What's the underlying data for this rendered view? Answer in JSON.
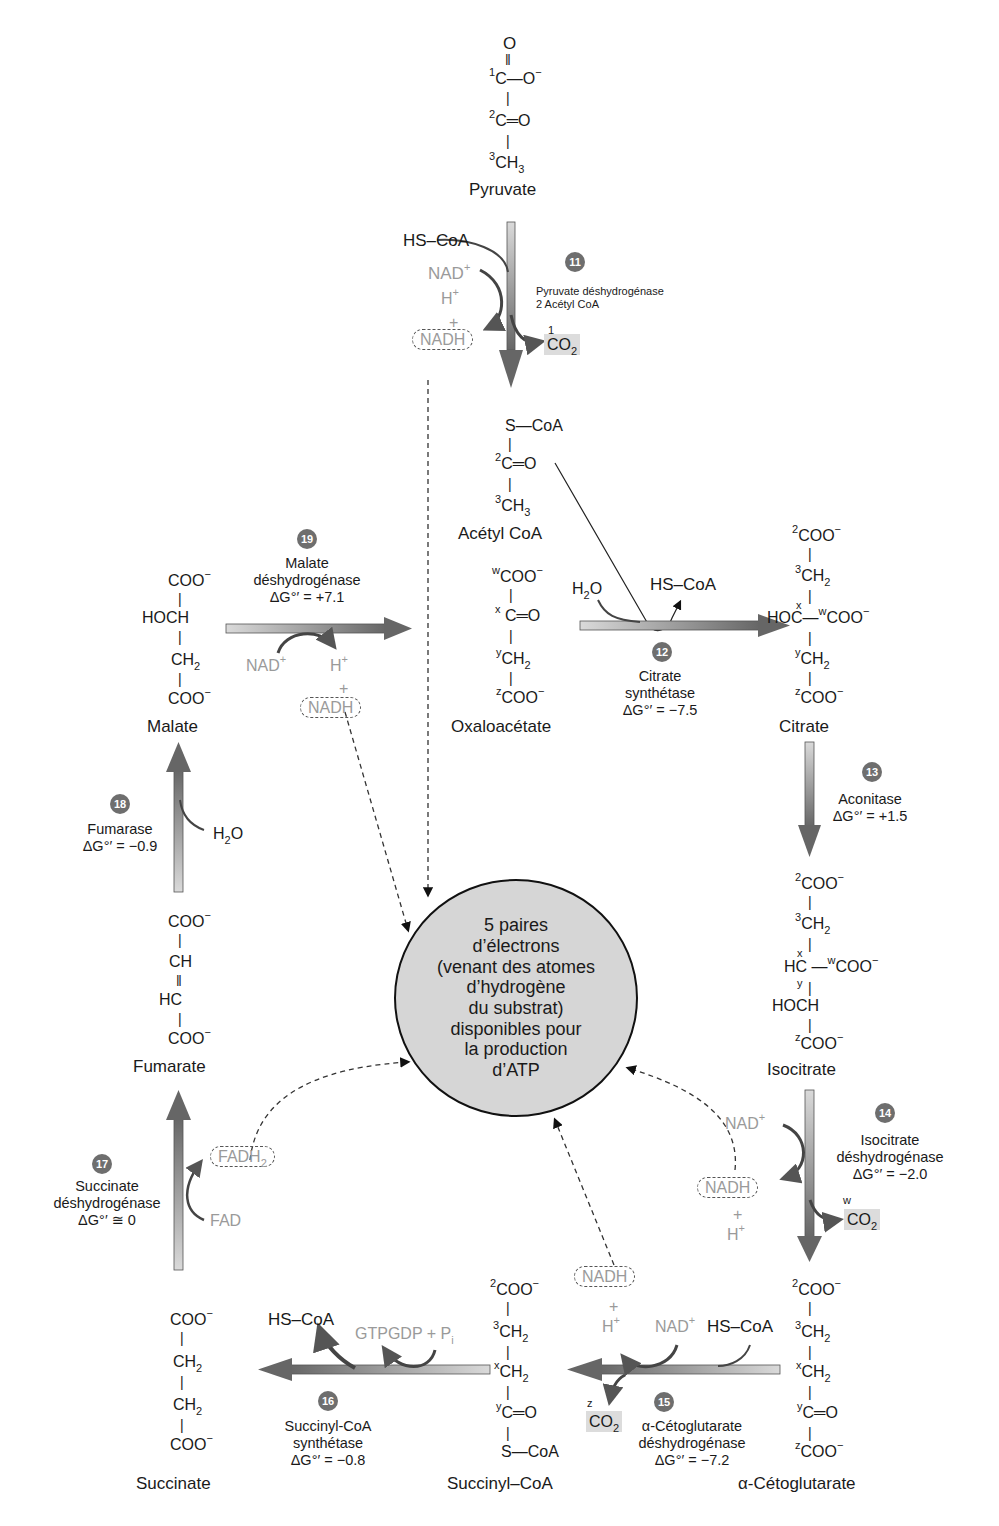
{
  "colors": {
    "badge": "#6e6e6e",
    "arrow_light": "#d0d0d0",
    "arrow_dark": "#6a6a6a",
    "cofactor_grey": "#9a9a9a",
    "co2_box": "#dcdcdc",
    "circle_fill": "#d6d6d6"
  },
  "center": {
    "lines": [
      "5 paires",
      "d’électrons",
      "(venant des atomes",
      "d’hydrogène",
      "du substrat)",
      "disponibles pour",
      "la production",
      "d’ATP"
    ]
  },
  "molecules": {
    "pyruvate": {
      "name": "Pyruvate",
      "atoms": [
        "O",
        "C—O⁻",
        "C═O",
        "CH3"
      ],
      "numbers": [
        "1",
        "2",
        "3"
      ]
    },
    "acetyl_coa": {
      "name": "Acétyl CoA",
      "atoms": [
        "S—CoA",
        "C═O",
        "CH3"
      ],
      "numbers": [
        "2",
        "3"
      ]
    },
    "oxaloacetate": {
      "name": "Oxaloacétate",
      "atoms": [
        "COO⁻",
        "C═O",
        "CH2",
        "COO⁻"
      ],
      "labels": [
        "w",
        "x",
        "y",
        "z"
      ]
    },
    "citrate": {
      "name": "Citrate",
      "atoms": [
        "COO⁻",
        "CH2",
        "HOC—COO⁻",
        "CH2",
        "COO⁻"
      ],
      "labels": [
        "2",
        "3",
        "x",
        "w",
        "y",
        "z"
      ]
    },
    "isocitrate": {
      "name": "Isocitrate",
      "atoms": [
        "COO⁻",
        "CH2",
        "HC—COO⁻",
        "HOCH",
        "COO⁻"
      ],
      "labels": [
        "2",
        "3",
        "x",
        "w",
        "y",
        "z"
      ]
    },
    "alpha_cetoglutarate": {
      "name": "α-Cétoglutarate",
      "atoms": [
        "COO⁻",
        "CH2",
        "CH2",
        "C═O",
        "COO⁻"
      ],
      "labels": [
        "2",
        "3",
        "x",
        "y",
        "z"
      ]
    },
    "succinyl_coa": {
      "name": "Succinyl–CoA",
      "atoms": [
        "COO⁻",
        "CH2",
        "CH2",
        "C═O",
        "S—CoA"
      ],
      "labels": [
        "2",
        "3",
        "x",
        "y"
      ]
    },
    "succinate": {
      "name": "Succinate",
      "atoms": [
        "COO⁻",
        "CH2",
        "CH2",
        "COO⁻"
      ]
    },
    "fumarate": {
      "name": "Fumarate",
      "atoms": [
        "COO⁻",
        "CH",
        "HC",
        "COO⁻"
      ]
    },
    "malate": {
      "name": "Malate",
      "atoms": [
        "COO⁻",
        "HOCH",
        "CH2",
        "COO⁻"
      ]
    }
  },
  "steps": [
    {
      "num": "11",
      "enzyme": [
        "Pyruvate déshydrogénase",
        "2 Acétyl CoA"
      ],
      "dg": "",
      "inputs": [
        "HS–CoA",
        "NAD⁺"
      ],
      "outputs": [
        "H⁺",
        "+",
        "NADH",
        "CO2"
      ],
      "co2_label": "1"
    },
    {
      "num": "12",
      "enzyme": [
        "Citrate",
        "synthétase"
      ],
      "dg_prefix": "ΔG",
      "dg": "°′ = −7.5",
      "inputs": [
        "H2O"
      ],
      "outputs": [
        "HS–CoA"
      ]
    },
    {
      "num": "13",
      "enzyme": [
        "Aconitase"
      ],
      "dg_prefix": "ΔG",
      "dg": "°′ = +1.5"
    },
    {
      "num": "14",
      "enzyme": [
        "Isocitrate",
        "déshydrogénase"
      ],
      "dg_prefix": "ΔG",
      "dg": "°′ = −2.0",
      "inputs": [
        "NAD⁺"
      ],
      "outputs": [
        "NADH",
        "+",
        "H⁺",
        "CO2"
      ],
      "co2_label": "w"
    },
    {
      "num": "15",
      "enzyme": [
        "α-Cétoglutarate",
        "déshydrogénase"
      ],
      "dg_prefix": "ΔG",
      "dg": "°′ = −7.2",
      "inputs": [
        "NAD⁺",
        "HS–CoA"
      ],
      "outputs": [
        "NADH",
        "+",
        "H⁺",
        "CO2"
      ],
      "co2_label": "z"
    },
    {
      "num": "16",
      "enzyme": [
        "Succinyl-CoA",
        "synthétase"
      ],
      "dg_prefix": "ΔG",
      "dg": "°′ = −0.8",
      "inputs": [
        "GTP",
        "GDP + P"
      ],
      "outputs": [
        "HS–CoA"
      ],
      "pi_sub": "i"
    },
    {
      "num": "17",
      "enzyme": [
        "Succinate",
        "déshydrogénase"
      ],
      "dg_prefix": "ΔG",
      "dg": "°′ ≅ 0",
      "inputs": [
        "FAD"
      ],
      "outputs": [
        "FADH2"
      ]
    },
    {
      "num": "18",
      "enzyme": [
        "Fumarase"
      ],
      "dg_prefix": "ΔG",
      "dg": "°′ = −0.9",
      "inputs": [
        "H2O"
      ]
    },
    {
      "num": "19",
      "enzyme": [
        "Malate",
        "déshydrogénase"
      ],
      "dg_prefix": "ΔG",
      "dg": "°′ = +7.1",
      "inputs": [
        "NAD⁺"
      ],
      "outputs": [
        "H⁺",
        "+",
        "NADH"
      ]
    }
  ],
  "text": {
    "O": "O",
    "C": "C",
    "CH": "CH",
    "HC": "HC",
    "HOCH": "HOCH",
    "HOC": "HOC",
    "COO": "COO",
    "minus": "−",
    "O_minus": "O",
    "CH3_main": "CH",
    "three": "3",
    "two": "2",
    "S_CoA": "S",
    "CoA": "CoA",
    "HS_CoA": "HS–CoA",
    "NAD": "NAD",
    "plus_sup": "+",
    "H": "H",
    "NADH": "NADH",
    "plus": "+",
    "CO": "CO",
    "H2O_H": "H",
    "H2O_O": "O",
    "FAD": "FAD",
    "FADH": "FADH",
    "GTPGDP": "GTPGDP + P",
    "eq_O": "═O",
    "dash": "—",
    "bond": "|",
    "dbl": "‖"
  }
}
